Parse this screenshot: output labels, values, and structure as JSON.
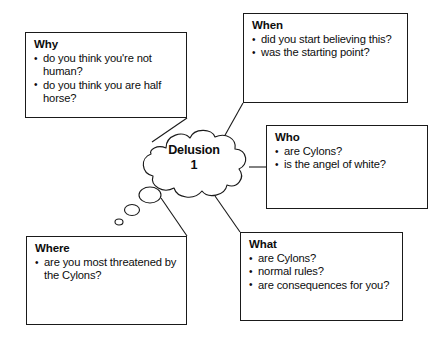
{
  "diagram": {
    "type": "mind-map",
    "center": {
      "shape": "thought-bubble",
      "label_line1": "Delusion",
      "label_line2": "1"
    },
    "boxes": [
      {
        "id": "why",
        "title": "Why",
        "items": [
          "do you think you're not human?",
          "do you think you are half horse?"
        ]
      },
      {
        "id": "when",
        "title": "When",
        "items": [
          "did you start believing this?",
          "was the starting point?"
        ]
      },
      {
        "id": "who",
        "title": "Who",
        "items": [
          "are Cylons?",
          "is the angel of white?"
        ]
      },
      {
        "id": "where",
        "title": "Where",
        "items": [
          "are you most threatened by the Cylons?"
        ]
      },
      {
        "id": "what",
        "title": "What",
        "items": [
          "are Cylons?",
          "normal rules?",
          "are consequences for you?"
        ]
      }
    ],
    "colors": {
      "ink": "#1a1a1a",
      "background": "#ffffff"
    }
  }
}
